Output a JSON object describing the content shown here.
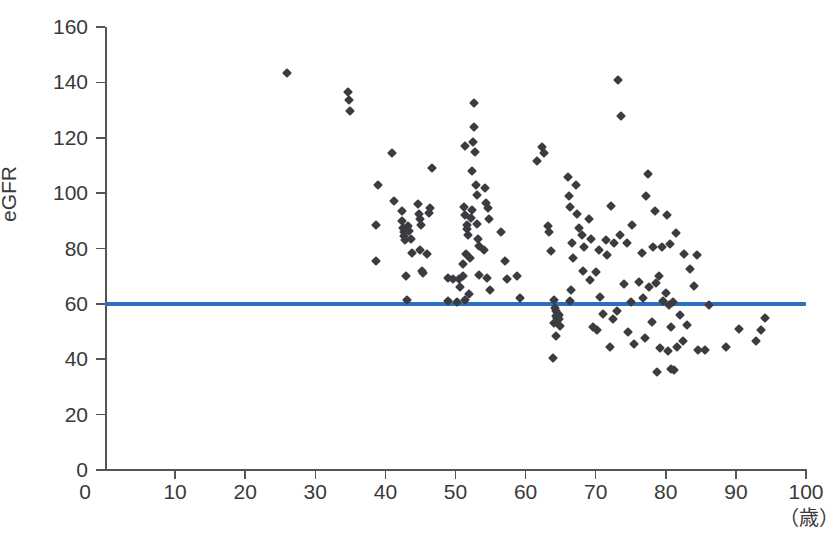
{
  "chart_data": {
    "type": "scatter",
    "title": "",
    "xlabel": "",
    "ylabel": "eGFR",
    "x_unit": "（歳）",
    "xlim": [
      0,
      100
    ],
    "ylim": [
      0,
      160
    ],
    "xticks": [
      0,
      10,
      20,
      30,
      40,
      50,
      60,
      70,
      80,
      90,
      100
    ],
    "yticks": [
      0,
      20,
      40,
      60,
      80,
      100,
      120,
      140,
      160
    ],
    "xtick_labels": [
      "0",
      "10",
      "20",
      "30",
      "40",
      "50",
      "60",
      "70",
      "80",
      "90",
      "100"
    ],
    "ytick_labels": [
      "0",
      "20",
      "40",
      "60",
      "80",
      "100",
      "120",
      "140",
      "160"
    ],
    "grid": false,
    "legend": "none",
    "marker": {
      "shape": "diamond",
      "color": "#3b3b40",
      "size": 7
    },
    "reference_line": {
      "orientation": "horizontal",
      "y": 60,
      "color": "#2a6fc2",
      "width": 4,
      "x_start": 0,
      "x_end": 100
    },
    "series": [
      {
        "name": "eGFR by age",
        "points": [
          [
            26,
            143.5
          ],
          [
            34.7,
            136.5
          ],
          [
            34.8,
            133.5
          ],
          [
            35.0,
            129.5
          ],
          [
            39.0,
            103.0
          ],
          [
            38.6,
            88.5
          ],
          [
            38.7,
            75.5
          ],
          [
            41.0,
            114.5
          ],
          [
            41.2,
            97.0
          ],
          [
            42.3,
            93.5
          ],
          [
            42.4,
            90.0
          ],
          [
            42.5,
            87.5
          ],
          [
            42.6,
            86.0
          ],
          [
            42.7,
            84.5
          ],
          [
            42.8,
            83.0
          ],
          [
            43.2,
            88.0
          ],
          [
            43.4,
            86.5
          ],
          [
            43.6,
            83.5
          ],
          [
            43.8,
            78.5
          ],
          [
            43.0,
            70.0
          ],
          [
            43.1,
            61.5
          ],
          [
            44.6,
            96.0
          ],
          [
            44.8,
            92.5
          ],
          [
            45.0,
            90.5
          ],
          [
            45.1,
            88.5
          ],
          [
            44.9,
            79.5
          ],
          [
            45.2,
            72.0
          ],
          [
            45.3,
            71.0
          ],
          [
            46.6,
            109.0
          ],
          [
            46.4,
            94.5
          ],
          [
            46.2,
            93.0
          ],
          [
            46.0,
            78.0
          ],
          [
            48.9,
            69.5
          ],
          [
            49.0,
            61.0
          ],
          [
            49.6,
            69.0
          ],
          [
            50.5,
            69.0
          ],
          [
            50.7,
            66.0
          ],
          [
            50.2,
            60.5
          ],
          [
            51.4,
            117.0
          ],
          [
            51.2,
            95.0
          ],
          [
            51.3,
            92.0
          ],
          [
            51.6,
            88.5
          ],
          [
            51.7,
            87.0
          ],
          [
            51.8,
            85.0
          ],
          [
            51.5,
            78.0
          ],
          [
            51.1,
            74.5
          ],
          [
            51.0,
            70.0
          ],
          [
            51.9,
            63.5
          ],
          [
            51.3,
            61.5
          ],
          [
            52.6,
            132.5
          ],
          [
            52.7,
            124.0
          ],
          [
            52.5,
            118.5
          ],
          [
            52.8,
            115.0
          ],
          [
            52.4,
            108.0
          ],
          [
            52.9,
            103.0
          ],
          [
            53.0,
            99.5
          ],
          [
            52.3,
            94.0
          ],
          [
            52.2,
            91.0
          ],
          [
            53.1,
            89.0
          ],
          [
            53.2,
            83.5
          ],
          [
            53.3,
            81.0
          ],
          [
            52.1,
            76.5
          ],
          [
            53.4,
            70.5
          ],
          [
            54.2,
            102.0
          ],
          [
            54.4,
            96.5
          ],
          [
            54.6,
            94.5
          ],
          [
            54.8,
            90.5
          ],
          [
            54.0,
            79.5
          ],
          [
            54.5,
            69.5
          ],
          [
            54.9,
            65.0
          ],
          [
            56.5,
            86.0
          ],
          [
            57.0,
            75.5
          ],
          [
            57.4,
            69.0
          ],
          [
            58.8,
            70.0
          ],
          [
            59.2,
            62.0
          ],
          [
            61.6,
            111.5
          ],
          [
            62.4,
            116.5
          ],
          [
            62.6,
            114.5
          ],
          [
            63.2,
            88.0
          ],
          [
            63.4,
            86.0
          ],
          [
            63.6,
            79.0
          ],
          [
            64.0,
            61.5
          ],
          [
            64.2,
            58.5
          ],
          [
            64.4,
            57.5
          ],
          [
            64.6,
            56.5
          ],
          [
            64.8,
            56.0
          ],
          [
            64.3,
            55.5
          ],
          [
            64.5,
            55.0
          ],
          [
            64.7,
            54.5
          ],
          [
            64.1,
            53.0
          ],
          [
            64.9,
            52.0
          ],
          [
            64.4,
            48.5
          ],
          [
            63.9,
            40.5
          ],
          [
            66.0,
            106.0
          ],
          [
            66.2,
            99.0
          ],
          [
            66.4,
            95.0
          ],
          [
            66.6,
            82.0
          ],
          [
            66.8,
            76.5
          ],
          [
            66.5,
            65.0
          ],
          [
            66.3,
            61.0
          ],
          [
            67.2,
            103.0
          ],
          [
            67.4,
            92.5
          ],
          [
            67.6,
            87.5
          ],
          [
            68.0,
            85.0
          ],
          [
            68.4,
            80.5
          ],
          [
            68.2,
            72.0
          ],
          [
            69.0,
            90.5
          ],
          [
            69.4,
            83.5
          ],
          [
            69.2,
            68.5
          ],
          [
            69.6,
            51.5
          ],
          [
            70.4,
            79.5
          ],
          [
            70.0,
            71.5
          ],
          [
            70.6,
            62.5
          ],
          [
            70.2,
            50.5
          ],
          [
            71.4,
            83.0
          ],
          [
            71.6,
            77.5
          ],
          [
            71.0,
            56.5
          ],
          [
            72.2,
            95.5
          ],
          [
            72.6,
            82.0
          ],
          [
            72.4,
            54.5
          ],
          [
            72.0,
            44.5
          ],
          [
            73.2,
            141.0
          ],
          [
            73.6,
            128.0
          ],
          [
            73.4,
            85.0
          ],
          [
            73.0,
            57.5
          ],
          [
            74.4,
            82.0
          ],
          [
            74.0,
            67.0
          ],
          [
            74.6,
            50.0
          ],
          [
            75.2,
            88.5
          ],
          [
            75.0,
            60.5
          ],
          [
            75.4,
            45.5
          ],
          [
            76.6,
            78.5
          ],
          [
            76.2,
            68.0
          ],
          [
            76.8,
            62.0
          ],
          [
            77.4,
            107.0
          ],
          [
            77.2,
            99.0
          ],
          [
            77.6,
            66.0
          ],
          [
            77.0,
            47.5
          ],
          [
            78.4,
            93.5
          ],
          [
            78.2,
            80.5
          ],
          [
            78.6,
            67.5
          ],
          [
            78.0,
            53.5
          ],
          [
            78.8,
            35.5
          ],
          [
            79.4,
            80.5
          ],
          [
            79.0,
            70.0
          ],
          [
            79.6,
            61.0
          ],
          [
            79.2,
            44.0
          ],
          [
            80.2,
            92.0
          ],
          [
            80.6,
            81.5
          ],
          [
            80.0,
            64.0
          ],
          [
            80.4,
            59.5
          ],
          [
            80.8,
            51.5
          ],
          [
            80.3,
            43.0
          ],
          [
            80.7,
            36.5
          ],
          [
            81.4,
            85.5
          ],
          [
            81.0,
            60.5
          ],
          [
            81.6,
            44.5
          ],
          [
            81.2,
            36.0
          ],
          [
            82.6,
            78.0
          ],
          [
            82.0,
            56.0
          ],
          [
            82.4,
            46.5
          ],
          [
            83.4,
            72.5
          ],
          [
            83.0,
            52.5
          ],
          [
            84.4,
            77.5
          ],
          [
            84.0,
            66.5
          ],
          [
            84.6,
            43.5
          ],
          [
            85.6,
            43.5
          ],
          [
            86.2,
            59.5
          ],
          [
            88.6,
            44.5
          ],
          [
            90.4,
            51.0
          ],
          [
            92.8,
            46.5
          ],
          [
            94.2,
            55.0
          ],
          [
            93.6,
            50.5
          ]
        ]
      }
    ]
  }
}
